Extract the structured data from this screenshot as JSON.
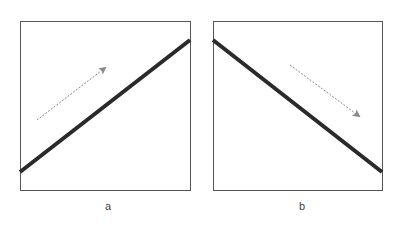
{
  "panels": [
    {
      "label": "a",
      "direction": "increasing",
      "line_color": "#2a2a2a",
      "arrow_color": "#8a8a8a"
    },
    {
      "label": "b",
      "direction": "decreasing",
      "line_color": "#2a2a2a",
      "arrow_color": "#8a8a8a"
    }
  ]
}
